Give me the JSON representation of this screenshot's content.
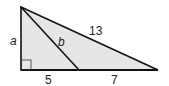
{
  "diagram": {
    "type": "right-triangle",
    "fill_color": "#e6e6e6",
    "stroke_color": "#111111",
    "labels": {
      "side_a": "a",
      "segment_b": "b",
      "hypotenuse": "13",
      "base_left": "5",
      "base_right": "7"
    },
    "right_angle_marker": true
  }
}
